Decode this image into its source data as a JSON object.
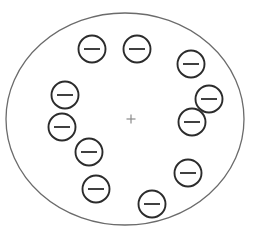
{
  "canvas": {
    "width": 257,
    "height": 236,
    "background_color": "#ffffff"
  },
  "outer_boundary": {
    "shape_name": "large-outline-ellipse",
    "center_x": 125,
    "center_y": 119,
    "radius_x": 119,
    "radius_y": 106,
    "stroke_color": "#6b6b6b",
    "stroke_width": 1.3,
    "fill": "none"
  },
  "center_marker": {
    "shape_name": "fixation-cross",
    "symbol": "+",
    "x": 131,
    "y": 119,
    "arm_length": 9,
    "stroke_color": "#8a8a8a",
    "stroke_width": 1.2
  },
  "token_style": {
    "radius": 13.5,
    "circle_stroke_color": "#2b2b2b",
    "circle_stroke_width": 1.9,
    "circle_fill": "#ffffff",
    "minus_color": "#2b2b2b",
    "minus_stroke_width": 1.8,
    "minus_half_width": 8,
    "symbol": "−",
    "label": "minus"
  },
  "tokens": [
    {
      "id": 1,
      "name": "minus-circle-1",
      "cx": 92,
      "cy": 49
    },
    {
      "id": 2,
      "name": "minus-circle-2",
      "cx": 137,
      "cy": 49
    },
    {
      "id": 3,
      "name": "minus-circle-3",
      "cx": 191,
      "cy": 64
    },
    {
      "id": 4,
      "name": "minus-circle-4",
      "cx": 209,
      "cy": 99
    },
    {
      "id": 5,
      "name": "minus-circle-5",
      "cx": 192,
      "cy": 122
    },
    {
      "id": 6,
      "name": "minus-circle-6",
      "cx": 188,
      "cy": 173
    },
    {
      "id": 7,
      "name": "minus-circle-7",
      "cx": 152,
      "cy": 204
    },
    {
      "id": 8,
      "name": "minus-circle-8",
      "cx": 96,
      "cy": 189
    },
    {
      "id": 9,
      "name": "minus-circle-9",
      "cx": 89,
      "cy": 152
    },
    {
      "id": 10,
      "name": "minus-circle-10",
      "cx": 62,
      "cy": 127
    },
    {
      "id": 11,
      "name": "minus-circle-11",
      "cx": 65,
      "cy": 95
    }
  ],
  "counts": {
    "token_count": 11
  }
}
